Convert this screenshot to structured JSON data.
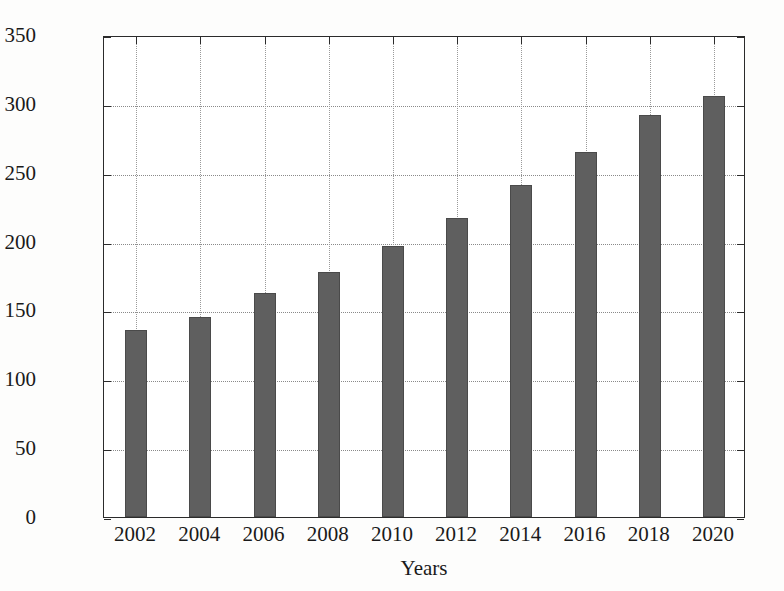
{
  "chart_data": {
    "type": "bar",
    "title": "",
    "xlabel": "Years",
    "ylabel": "CO2e emissions (Mtons)",
    "ylabel_parts": {
      "pre": "CO",
      "sub": "2",
      "post": "e emissions (Mtons)"
    },
    "categories": [
      "2002",
      "2004",
      "2006",
      "2008",
      "2010",
      "2012",
      "2014",
      "2016",
      "2018",
      "2020"
    ],
    "values": [
      136,
      145,
      163,
      178,
      197,
      217,
      241,
      265,
      292,
      306
    ],
    "ylim": [
      0,
      350
    ],
    "xlim_categories": 10,
    "yticks": [
      0,
      50,
      100,
      150,
      200,
      250,
      300,
      350
    ],
    "ytick_labels": [
      "0",
      "50",
      "100",
      "150",
      "200",
      "250",
      "300",
      "350"
    ],
    "grid": true,
    "grid_style": "dotted",
    "legend": false,
    "bar_color": "#5f5f5f",
    "axis_color": "#2b2b2b",
    "background": "#ffffff"
  }
}
